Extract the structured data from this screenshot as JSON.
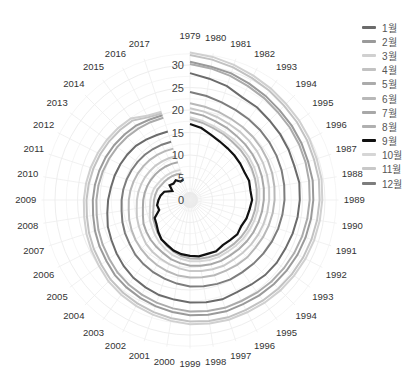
{
  "chart_data": {
    "type": "polar-line",
    "title": "",
    "radial_ticks": [
      0,
      5,
      10,
      15,
      20,
      25,
      30
    ],
    "radial_range": [
      0,
      33
    ],
    "grid": true,
    "legend_position": "right",
    "categories": [
      "1979",
      "1980",
      "1981",
      "1982",
      "1993",
      "1994",
      "1995",
      "1996",
      "1987",
      "1988",
      "1989",
      "1990",
      "1991",
      "1992",
      "1993",
      "1994",
      "1995",
      "1996",
      "1997",
      "1998",
      "1999",
      "2000",
      "2001",
      "2002",
      "2003",
      "2004",
      "2005",
      "2006",
      "2007",
      "2008",
      "2009",
      "2010",
      "2011",
      "2012",
      "2013",
      "2014",
      "2015",
      "2016",
      "2017"
    ],
    "series": [
      {
        "name": "1월",
        "color": "#6b6b6b",
        "width": 2.0,
        "values": [
          28.2,
          27.3,
          26.6,
          25.6,
          25.4,
          25.0,
          24.8,
          24.6,
          24.4,
          24.6,
          24.4,
          24.2,
          24.0,
          23.8,
          23.8,
          23.6,
          23.2,
          23.0,
          23.2,
          23.0,
          22.8,
          22.4,
          22.2,
          21.8,
          21.4,
          20.8,
          20.2,
          19.6,
          19.2,
          18.6,
          18.2,
          17.8,
          17.6,
          17.4,
          17.2,
          17.0,
          16.6,
          16.2,
          16.0
        ]
      },
      {
        "name": "2월",
        "color": "#9a9a9a",
        "width": 2.0,
        "values": [
          30.7,
          30.0,
          29.6,
          29.0,
          28.6,
          28.2,
          28.0,
          27.8,
          27.6,
          27.6,
          27.4,
          27.2,
          27.0,
          26.8,
          26.6,
          26.4,
          26.2,
          26.0,
          26.0,
          25.8,
          25.6,
          25.2,
          24.8,
          24.4,
          24.0,
          23.6,
          23.0,
          22.6,
          22.2,
          21.8,
          21.6,
          21.4,
          21.2,
          21.0,
          20.8,
          20.6,
          20.4,
          20.0,
          19.8
        ]
      },
      {
        "name": "3월",
        "color": "#d0d0d0",
        "width": 2.0,
        "values": [
          32.8,
          32.2,
          31.6,
          31.0,
          30.6,
          30.2,
          30.0,
          29.8,
          29.6,
          29.6,
          29.4,
          29.2,
          29.0,
          28.8,
          28.6,
          28.4,
          28.2,
          28.0,
          28.0,
          27.8,
          27.6,
          27.2,
          26.8,
          26.4,
          26.0,
          25.6,
          25.0,
          24.6,
          24.2,
          23.8,
          23.6,
          23.4,
          23.2,
          23.0,
          22.8,
          22.6,
          22.4,
          21.0,
          20.6
        ]
      },
      {
        "name": "4월",
        "color": "#c2c2c2",
        "width": 2.0,
        "values": [
          32.2,
          31.6,
          31.0,
          30.4,
          30.0,
          29.6,
          29.4,
          29.2,
          29.0,
          29.0,
          28.8,
          28.6,
          28.4,
          28.2,
          28.0,
          27.8,
          27.6,
          27.4,
          27.4,
          27.2,
          27.0,
          26.6,
          26.2,
          25.8,
          25.4,
          25.0,
          24.4,
          24.0,
          23.6,
          23.2,
          23.0,
          22.8,
          22.6,
          22.4,
          22.2,
          22.0,
          21.8,
          20.6,
          20.2
        ]
      },
      {
        "name": "5월",
        "color": "#ababab",
        "width": 2.0,
        "values": [
          30.2,
          29.6,
          29.0,
          28.4,
          28.0,
          27.6,
          27.4,
          27.2,
          27.0,
          26.8,
          26.6,
          26.4,
          26.2,
          26.0,
          25.8,
          25.6,
          25.4,
          25.2,
          25.2,
          25.0,
          24.8,
          24.4,
          24.0,
          23.6,
          23.2,
          22.8,
          22.2,
          21.8,
          21.4,
          21.0,
          20.8,
          20.6,
          20.4,
          20.2,
          20.0,
          19.8,
          19.6,
          19.4,
          19.2
        ]
      },
      {
        "name": "6월",
        "color": "#b8b8b8",
        "width": 2.0,
        "values": [
          21.5,
          21.0,
          20.6,
          20.2,
          20.0,
          19.8,
          19.6,
          19.4,
          19.2,
          19.0,
          18.8,
          18.6,
          18.4,
          18.2,
          18.0,
          18.0,
          17.8,
          17.6,
          17.6,
          17.4,
          17.2,
          17.0,
          16.6,
          16.2,
          15.8,
          15.4,
          15.0,
          14.6,
          14.2,
          13.8,
          13.6,
          13.4,
          13.2,
          13.0,
          12.8,
          12.6,
          12.4,
          12.2,
          12.0
        ]
      },
      {
        "name": "7월",
        "color": "#a8a8a8",
        "width": 2.0,
        "values": [
          19.5,
          19.0,
          18.4,
          18.0,
          17.6,
          17.4,
          17.2,
          17.0,
          16.8,
          16.6,
          16.4,
          16.2,
          16.0,
          15.8,
          15.6,
          15.4,
          15.2,
          15.2,
          15.0,
          14.8,
          14.6,
          14.2,
          13.8,
          13.2,
          12.8,
          12.4,
          12.0,
          11.6,
          11.0,
          10.6,
          10.4,
          10.2,
          10.0,
          9.8,
          9.6,
          9.4,
          9.2,
          9.0,
          8.8
        ]
      },
      {
        "name": "8월",
        "color": "#b0b0b0",
        "width": 2.0,
        "values": [
          18.0,
          17.4,
          16.8,
          16.4,
          16.0,
          15.8,
          15.6,
          15.4,
          15.2,
          15.0,
          14.8,
          14.6,
          14.4,
          14.2,
          14.0,
          13.8,
          13.6,
          13.6,
          13.4,
          13.2,
          13.0,
          12.6,
          12.0,
          11.4,
          10.8,
          10.2,
          9.6,
          9.2,
          8.6,
          8.2,
          8.0,
          7.8,
          7.6,
          7.2,
          7.0,
          6.8,
          6.6,
          6.4,
          6.2
        ]
      },
      {
        "name": "9월",
        "color": "#111111",
        "width": 2.2,
        "values": [
          16.9,
          16.2,
          15.2,
          14.6,
          14.2,
          14.0,
          13.8,
          13.6,
          13.8,
          13.6,
          13.8,
          13.4,
          13.2,
          12.8,
          13.0,
          12.6,
          12.4,
          12.8,
          12.6,
          12.7,
          12.4,
          12.2,
          11.8,
          11.2,
          10.8,
          10.0,
          9.2,
          8.8,
          7.2,
          7.4,
          7.0,
          6.6,
          6.0,
          4.4,
          5.6,
          5.2,
          5.4,
          4.6,
          4.8
        ]
      },
      {
        "name": "10월",
        "color": "#d6d6d6",
        "width": 2.0,
        "values": [
          18.4,
          17.8,
          17.2,
          16.8,
          16.6,
          16.4,
          16.2,
          16.0,
          15.8,
          15.6,
          15.4,
          15.2,
          15.0,
          14.8,
          14.6,
          14.4,
          14.2,
          14.2,
          14.0,
          13.8,
          13.6,
          13.2,
          12.8,
          12.2,
          11.6,
          11.0,
          10.4,
          10.0,
          9.4,
          9.0,
          8.8,
          8.6,
          8.4,
          8.0,
          7.8,
          7.6,
          7.4,
          7.2,
          7.0
        ]
      },
      {
        "name": "11월",
        "color": "#c8c8c8",
        "width": 2.0,
        "values": [
          20.4,
          19.9,
          19.4,
          19.0,
          18.8,
          18.6,
          18.4,
          18.2,
          18.0,
          17.8,
          17.6,
          17.4,
          17.2,
          17.0,
          16.8,
          16.6,
          16.4,
          16.4,
          16.2,
          16.0,
          15.8,
          15.4,
          15.0,
          14.6,
          14.2,
          13.8,
          13.2,
          12.8,
          12.4,
          12.0,
          11.8,
          11.6,
          11.4,
          11.2,
          11.0,
          10.8,
          10.6,
          10.4,
          10.2
        ]
      },
      {
        "name": "12월",
        "color": "#7d7d7d",
        "width": 2.0,
        "values": [
          24.0,
          23.4,
          22.8,
          22.4,
          22.2,
          22.0,
          21.8,
          21.6,
          21.4,
          21.2,
          21.0,
          20.8,
          20.6,
          20.4,
          20.2,
          20.0,
          19.8,
          19.8,
          19.6,
          19.4,
          19.2,
          18.8,
          18.4,
          18.0,
          17.6,
          17.2,
          16.6,
          16.2,
          15.8,
          15.4,
          15.2,
          15.0,
          14.8,
          14.6,
          14.4,
          14.2,
          14.0,
          13.8,
          13.6
        ]
      }
    ]
  },
  "legend": {
    "items": [
      "1월",
      "2월",
      "3월",
      "4월",
      "5월",
      "6월",
      "7월",
      "8월",
      "9월",
      "10월",
      "11월",
      "12월"
    ]
  }
}
